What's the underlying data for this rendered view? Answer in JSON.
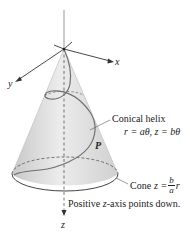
{
  "diagram": {
    "axes": {
      "x_label": "x",
      "y_label": "y",
      "z_label": "z"
    },
    "point_label": "P",
    "helix_label": {
      "title": "Conical helix",
      "equation": "r = aθ, z = bθ"
    },
    "cone_label": {
      "prefix": "Cone",
      "lhs": "z =",
      "numerator": "b",
      "denominator": "a",
      "rhs_var": "r"
    },
    "note": "Positive z-axis points down.",
    "note_parts": {
      "before": "Positive ",
      "var": "z",
      "after": "-axis points down."
    },
    "colors": {
      "cone_fill": "#d9d9d9",
      "cone_edge": "#555555",
      "helix": "#7a7a7a",
      "axis": "#333333"
    }
  }
}
